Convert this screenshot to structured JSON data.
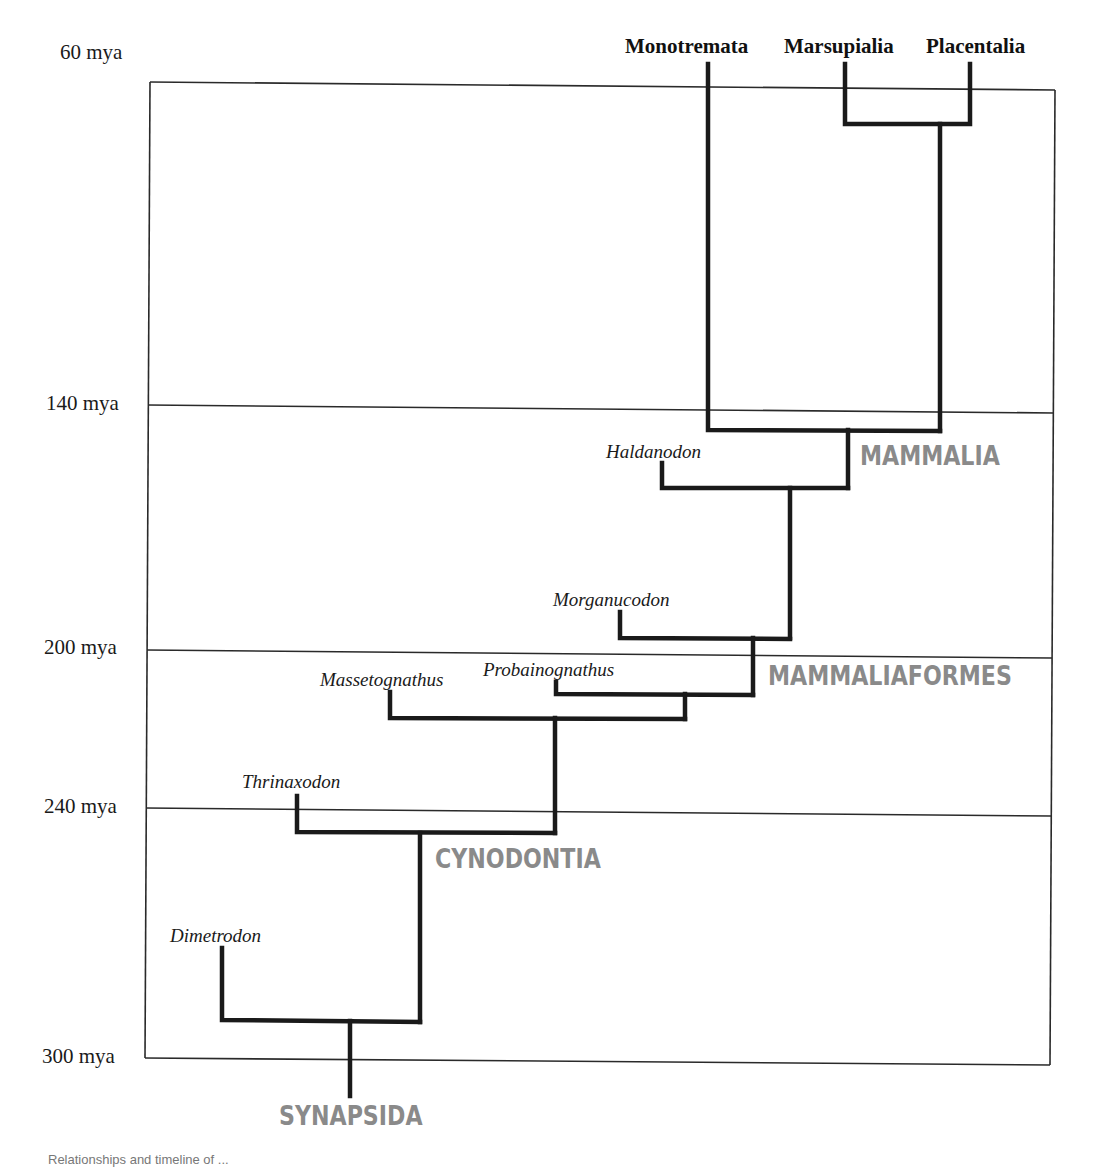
{
  "diagram": {
    "type": "phylogenetic-tree-timeline",
    "colors": {
      "branch": "#1a1a1a",
      "frame": "#2a2a2a",
      "clade_label": "#8a8a8a",
      "text": "#1a1a1a"
    }
  },
  "axis": {
    "ticks": [
      {
        "label": "60 mya",
        "value": 60
      },
      {
        "label": "140 mya",
        "value": 140
      },
      {
        "label": "200 mya",
        "value": 200
      },
      {
        "label": "240 mya",
        "value": 240
      },
      {
        "label": "300 mya",
        "value": 300
      }
    ]
  },
  "top_taxa": [
    {
      "label": "Monotremata"
    },
    {
      "label": "Marsupialia"
    },
    {
      "label": "Placentalia"
    }
  ],
  "taxa": [
    {
      "label": "Haldanodon"
    },
    {
      "label": "Morganucodon"
    },
    {
      "label": "Probainognathus"
    },
    {
      "label": "Massetognathus"
    },
    {
      "label": "Thrinaxodon"
    },
    {
      "label": "Dimetrodon"
    }
  ],
  "clades": [
    {
      "label": "MAMMALIA"
    },
    {
      "label": "MAMMALIAFORMES"
    },
    {
      "label": "CYNODONTIA"
    },
    {
      "label": "SYNAPSIDA"
    }
  ],
  "caption": {
    "text": "Relationships and timeline of ..."
  }
}
